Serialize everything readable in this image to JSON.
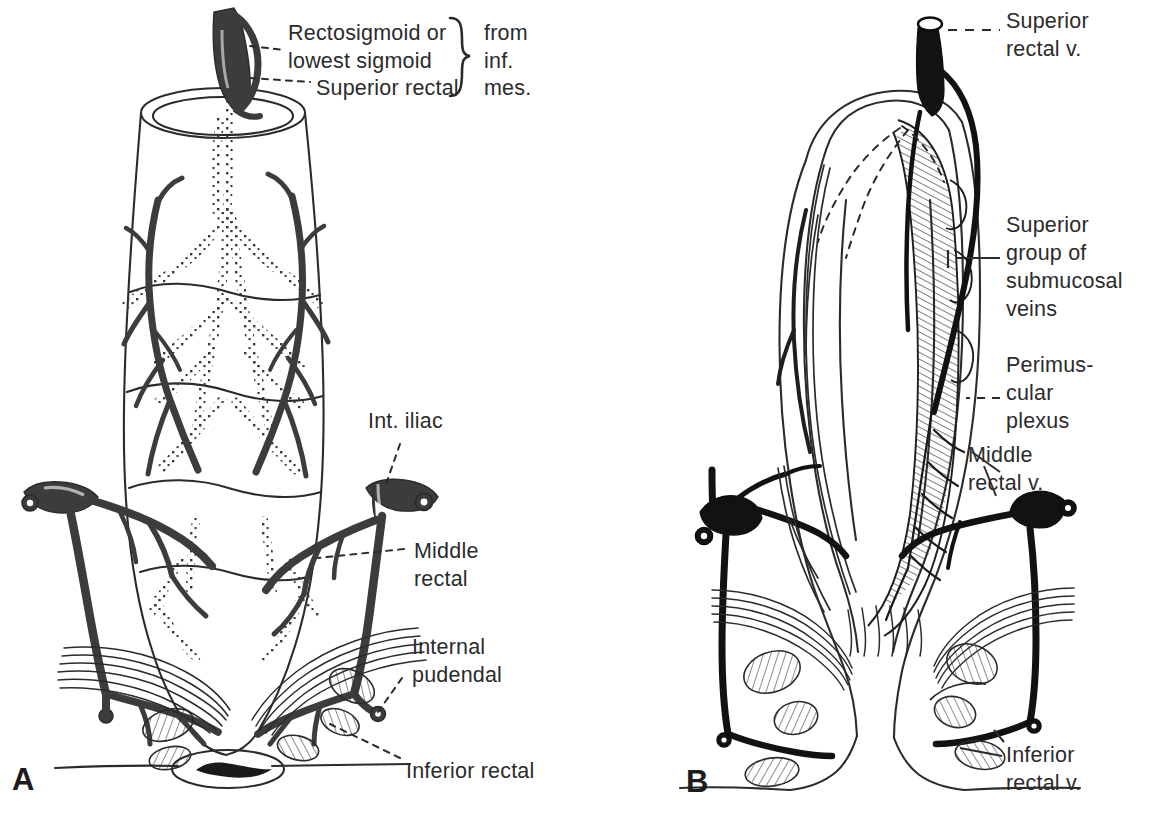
{
  "figure": {
    "type": "anatomical-illustration",
    "background_color": "#ffffff",
    "ink_color": "#2b2b2b",
    "vessel_color_panel_a": "#3c3c3c",
    "vessel_color_panel_b": "#121212"
  },
  "panels": [
    {
      "id": "A",
      "letter": "A",
      "caption": "Arterial supply (posterior view of rectum)",
      "labels": [
        {
          "id": "rectosigmoid",
          "text_lines": [
            "Rectosigmoid or",
            "lowest sigmoid"
          ],
          "leader": "dashed"
        },
        {
          "id": "superior-rectal",
          "text_lines": [
            "Superior rectal"
          ],
          "leader": "dashed"
        },
        {
          "id": "source-brace",
          "text_lines": [
            "from",
            "inf.",
            "mes."
          ],
          "brace": true
        },
        {
          "id": "int-iliac",
          "text_lines": [
            "Int. iliac"
          ],
          "leader": "dashed"
        },
        {
          "id": "middle-rectal",
          "text_lines": [
            "Middle",
            "rectal"
          ],
          "leader": "dashed"
        },
        {
          "id": "internal-pudendal",
          "text_lines": [
            "Internal",
            "pudendal"
          ],
          "leader": "dashed"
        },
        {
          "id": "inferior-rectal",
          "text_lines": [
            "Inferior rectal"
          ],
          "leader": "dashed"
        }
      ]
    },
    {
      "id": "B",
      "letter": "B",
      "caption": "Venous drainage (coronal section of rectum and anal canal)",
      "labels": [
        {
          "id": "superior-rectal-v",
          "text_lines": [
            "Superior",
            "rectal v."
          ],
          "leader": "dashed"
        },
        {
          "id": "superior-submucosal",
          "text_lines": [
            "Superior",
            "group of",
            "submucosal",
            "veins"
          ],
          "leader": "bracket"
        },
        {
          "id": "perimuscular-plexus",
          "text_lines": [
            "Perimus-",
            "cular",
            "plexus"
          ],
          "leader": "dashed"
        },
        {
          "id": "middle-rectal-v",
          "text_lines": [
            "Middle",
            "rectal v."
          ],
          "leader": "line"
        },
        {
          "id": "inferior-rectal-v",
          "text_lines": [
            "Inferior",
            "rectal v."
          ],
          "leader": "line"
        }
      ]
    }
  ],
  "text": {
    "a_rectosigmoid_1": "Rectosigmoid or",
    "a_rectosigmoid_2": "lowest sigmoid",
    "a_superior_rectal": "Superior rectal",
    "a_from": "from",
    "a_inf": "inf.",
    "a_mes": "mes.",
    "a_int_iliac": "Int. iliac",
    "a_middle_1": "Middle",
    "a_middle_2": "rectal",
    "a_pudendal_1": "Internal",
    "a_pudendal_2": "pudendal",
    "a_inferior_rectal": "Inferior rectal",
    "a_letter": "A",
    "b_sup_rectal_1": "Superior",
    "b_sup_rectal_2": "rectal v.",
    "b_submuc_1": "Superior",
    "b_submuc_2": "group of",
    "b_submuc_3": "submucosal",
    "b_submuc_4": "veins",
    "b_peri_1": "Perimus-",
    "b_peri_2": "cular",
    "b_peri_3": "plexus",
    "b_mid_1": "Middle",
    "b_mid_2": "rectal v.",
    "b_inf_1": "Inferior",
    "b_inf_2": "rectal v.",
    "b_letter": "B",
    "brace_glyph": "}"
  }
}
